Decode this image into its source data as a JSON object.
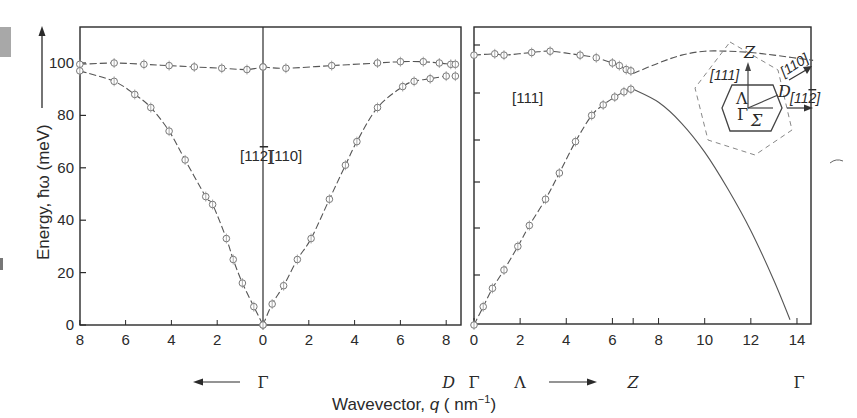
{
  "chart_data": {
    "type": "scatter",
    "title": "",
    "ylabel": "Energy, ħω (meV)",
    "xlabel": "Wavevector, q ( nm⁻¹)",
    "ylim": [
      0,
      115
    ],
    "panels": [
      {
        "name": "left",
        "direction_labels": [
          "[11̅2]",
          "[110]"
        ],
        "sub_panels": [
          {
            "direction": "[11-2]",
            "xlim": [
              8,
              0
            ],
            "xticks": [
              8,
              6,
              4,
              2,
              0
            ],
            "start_label": "Γ",
            "arrow": "left"
          },
          {
            "direction": "[110]",
            "xlim": [
              0,
              8.5
            ],
            "xticks": [
              0,
              2,
              4,
              6,
              8
            ],
            "end_label": "D"
          }
        ],
        "series": [
          {
            "name": "upper branch [11-2]",
            "x": [
              8.0,
              6.5,
              5.2,
              4.1,
              3.0,
              1.8,
              0.7,
              0.0
            ],
            "y": [
              99.5,
              100,
              99.5,
              99,
              98.5,
              98,
              97.5,
              98.5
            ]
          },
          {
            "name": "lower branch [11-2]",
            "x": [
              8.0,
              6.5,
              5.6,
              4.9,
              4.1,
              3.4,
              2.5,
              2.2,
              1.6,
              1.3,
              0.9,
              0.4,
              0.0
            ],
            "y": [
              97,
              93,
              88,
              83,
              74,
              63,
              49,
              46,
              33,
              25,
              16,
              7,
              0
            ]
          },
          {
            "name": "upper branch [110]",
            "x": [
              0.0,
              1.0,
              3.0,
              5.0,
              6.0,
              7.0,
              7.7,
              8.2,
              8.4
            ],
            "y": [
              98.5,
              98,
              99,
              100,
              100.5,
              100.5,
              100,
              99.5,
              99.5
            ]
          },
          {
            "name": "lower branch [110]",
            "x": [
              0.0,
              0.4,
              0.9,
              1.5,
              2.1,
              2.9,
              3.6,
              4.1,
              5.0,
              6.1,
              6.6,
              7.3,
              8.0,
              8.4
            ],
            "y": [
              0,
              8,
              15,
              25,
              33,
              48,
              61,
              70,
              83,
              91,
              93,
              94,
              95,
              95
            ]
          }
        ]
      },
      {
        "name": "right",
        "direction_labels": [
          "[111]"
        ],
        "xlim": [
          0,
          14.7
        ],
        "xticks": [
          0,
          2,
          4,
          6,
          8,
          10,
          12,
          14
        ],
        "minor_ticks": [
          6.9
        ],
        "point_labels": [
          {
            "x": 0,
            "label": "Γ"
          },
          {
            "x": 2,
            "label": "Λ"
          },
          {
            "x": 6.9,
            "label": "Z"
          },
          {
            "x": 14,
            "label": "Γ"
          }
        ],
        "series": [
          {
            "name": "upper branch [111]",
            "x": [
              0.0,
              0.9,
              1.3,
              2.5,
              3.3,
              4.6,
              5.3,
              6.0,
              6.3,
              6.6,
              6.8
            ],
            "y": [
              103,
              103.5,
              103,
              104,
              104.5,
              103,
              102,
              100,
              99,
              97.5,
              97
            ]
          },
          {
            "name": "lower branch [111]",
            "x": [
              0.0,
              0.4,
              0.8,
              1.3,
              1.9,
              2.4,
              3.1,
              3.7,
              4.4,
              5.1,
              5.6,
              6.1,
              6.5,
              6.8
            ],
            "y": [
              0,
              7,
              14,
              21,
              30,
              38,
              48,
              58,
              70,
              80,
              84,
              87,
              89,
              90
            ]
          },
          {
            "name": "upper curve continuation",
            "x": [
              6.9,
              8,
              9,
              10,
              11,
              12,
              13,
              14.7
            ],
            "y": [
              96,
              100,
              103,
              104.5,
              104.5,
              104,
              103,
              101
            ]
          },
          {
            "name": "lower curve continuation",
            "x": [
              6.9,
              8,
              9,
              10,
              11,
              12,
              13,
              13.7
            ],
            "y": [
              90,
              85,
              77,
              66,
              52,
              36,
              17,
              2
            ]
          }
        ]
      }
    ]
  },
  "labels": {
    "y_title": "Energy, ħω (meV)",
    "x_title": "Wavevector, q ( nm⁻¹)",
    "left_dir_1": "[112]",
    "left_dir_2": "[110]",
    "right_dir": "[111]",
    "gamma": "Γ",
    "lambda": "Λ",
    "z": "Z",
    "d": "D",
    "inset": {
      "z": "Z",
      "dir_111": "[111]",
      "dir_110": "[110]",
      "dir_112": "[112]",
      "lambda": "Λ",
      "gamma": "Γ",
      "sigma": "Σ",
      "d": "D"
    }
  },
  "yticks": [
    0,
    20,
    40,
    60,
    80,
    100
  ]
}
